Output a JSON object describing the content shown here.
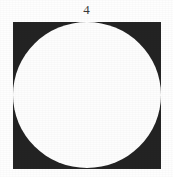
{
  "figure": {
    "label": "4",
    "caption_position": "above",
    "background_color": "#fefefe"
  },
  "diagram": {
    "type": "inscribed-circle-in-square",
    "shapes": [
      {
        "name": "square",
        "kind": "rectangle",
        "fill_color": "#232323",
        "x": 13,
        "y": 22,
        "width": 148,
        "height": 147
      },
      {
        "name": "circle",
        "kind": "ellipse",
        "fill_color": "#fdfdfd",
        "center_x": 87,
        "center_y": 95,
        "radius_x": 74,
        "radius_y": 73,
        "inscribed_in": "square"
      }
    ]
  }
}
